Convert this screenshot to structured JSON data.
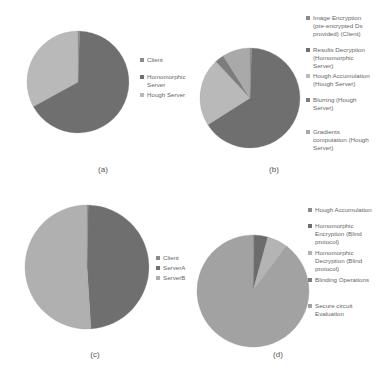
{
  "chart_data": [
    {
      "type": "pie",
      "panel": "(a)",
      "title": "",
      "categories": [
        "Client",
        "Homomorphic Server",
        "Hough Server"
      ],
      "values": [
        0.5,
        66.5,
        33
      ],
      "colors": [
        "#8a8a8a",
        "#6f6f6f",
        "#b9b9b9"
      ],
      "legend_position": "right",
      "caption": "(a)"
    },
    {
      "type": "pie",
      "panel": "(b)",
      "title": "",
      "categories": [
        "Image Encryption (pre-encrypted Ds provided) (Client)",
        "Results Decryption (Homomorphic Server)",
        "Hough Accumulation (Hough Server)",
        "Blurring (Hough Server)",
        "Gradients computation (Hough Server)"
      ],
      "values": [
        0.5,
        65.5,
        22,
        3,
        9
      ],
      "colors": [
        "#8a8a8a",
        "#6f6f6f",
        "#b9b9b9",
        "#7d7d7d",
        "#a9a9a9"
      ],
      "legend_position": "right",
      "caption": "(b)"
    },
    {
      "type": "pie",
      "panel": "(c)",
      "title": "",
      "categories": [
        "Client",
        "ServerA",
        "ServerB"
      ],
      "values": [
        0.3,
        48.7,
        51
      ],
      "colors": [
        "#8a8a8a",
        "#6f6f6f",
        "#b0b0b0"
      ],
      "legend_position": "right",
      "caption": "(c)"
    },
    {
      "type": "pie",
      "panel": "(d)",
      "title": "",
      "categories": [
        "Hough Accumulation",
        "Homomorphic Encryption (Blind protocol)",
        "Homomorphic Decryption (Blind protocol)",
        "Blinding Operations",
        "Secure circuit Evaluation"
      ],
      "values": [
        0.3,
        4,
        6,
        0.2,
        89.5
      ],
      "colors": [
        "#8a8a8a",
        "#6c6c6c",
        "#b4b4b4",
        "#7d7d7d",
        "#a2a2a2"
      ],
      "legend_position": "right",
      "caption": "(d)"
    }
  ],
  "panels": {
    "a": {
      "caption": "(a)",
      "legend": [
        "Client",
        "Homomorphic Server",
        "Hough Server"
      ]
    },
    "b": {
      "caption": "(b)",
      "legend": [
        "Image Encryption (pre-encrypted Ds provided) (Client)",
        "Results Decryption (Homomorphic Server)",
        "Hough Accumulation (Hough Server)",
        "Blurring (Hough Server)",
        "Gradients computation (Hough Server)"
      ]
    },
    "c": {
      "caption": "(c)",
      "legend": [
        "Client",
        "ServerA",
        "ServerB"
      ]
    },
    "d": {
      "caption": "(d)",
      "legend": [
        "Hough Accumulation",
        "Homomorphic Encryption (Blind protocol)",
        "Homomorphic Decryption (Blind protocol)",
        "Blinding Operations",
        "Secure circuit Evaluation"
      ]
    }
  }
}
